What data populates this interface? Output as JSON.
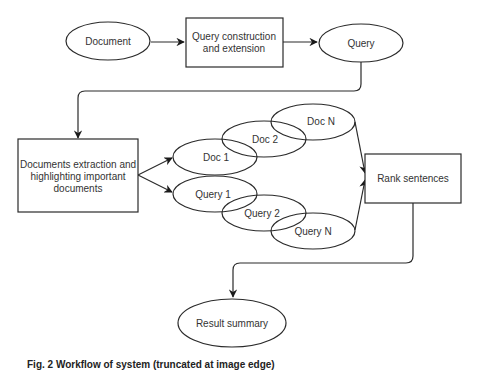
{
  "diagram": {
    "type": "flowchart",
    "nodes": {
      "document": {
        "label": "Document",
        "shape": "ellipse"
      },
      "query_construction": {
        "label_line1": "Query construction",
        "label_line2": "and extension",
        "shape": "rectangle"
      },
      "query": {
        "label": "Query",
        "shape": "ellipse"
      },
      "documents_extraction": {
        "label_line1": "Documents extraction and",
        "label_line2": "highlighting important",
        "label_line3": "documents",
        "shape": "rectangle"
      },
      "doc_1": {
        "label": "Doc 1",
        "shape": "ellipse"
      },
      "doc_2": {
        "label": "Doc 2",
        "shape": "ellipse"
      },
      "doc_n": {
        "label": "Doc N",
        "shape": "ellipse"
      },
      "query_1": {
        "label": "Query 1",
        "shape": "ellipse"
      },
      "query_2": {
        "label": "Query 2",
        "shape": "ellipse"
      },
      "query_n": {
        "label": "Query N",
        "shape": "ellipse"
      },
      "rank_sentences": {
        "label": "Rank sentences",
        "shape": "rectangle"
      },
      "result_summary": {
        "label": "Result summary",
        "shape": "ellipse"
      }
    },
    "edges": [
      {
        "from": "Document",
        "to": "Query construction and extension"
      },
      {
        "from": "Query construction and extension",
        "to": "Query"
      },
      {
        "from": "Query",
        "to": "Documents extraction and highlighting important documents"
      },
      {
        "from": "Documents extraction and highlighting important documents",
        "to": "Doc 1"
      },
      {
        "from": "Documents extraction and highlighting important documents",
        "to": "Query 1"
      },
      {
        "from": "Doc N",
        "to": "Rank sentences"
      },
      {
        "from": "Query N",
        "to": "Rank sentences"
      },
      {
        "from": "Rank sentences",
        "to": "Result summary"
      }
    ],
    "colors": {
      "stroke": "#2a2a2a",
      "text": "#333333",
      "background": "#ffffff"
    }
  },
  "caption": {
    "text": "Fig. 2  Workflow of system (truncated at image edge)"
  }
}
